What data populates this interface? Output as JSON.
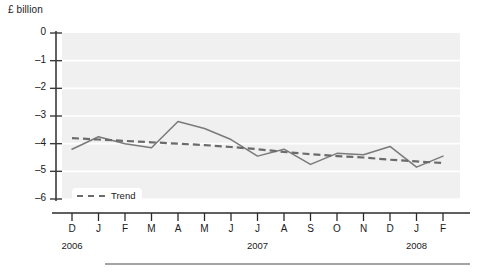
{
  "chart_data": {
    "type": "line",
    "title": "",
    "subtitle": "",
    "xlabel": "",
    "ylabel": "£ billion",
    "ylim": [
      -6,
      0
    ],
    "yticks": [
      0,
      -1,
      -2,
      -3,
      -4,
      -5,
      -6
    ],
    "ytick_labels": [
      "0",
      "–1",
      "–2",
      "–3",
      "–4",
      "–5",
      "–6"
    ],
    "grid": true,
    "grid_color": "#ffffff",
    "plot_bgcolor": "#f0f0f0",
    "legend_position": "bottom-left",
    "categories": [
      "D",
      "J",
      "F",
      "M",
      "A",
      "M",
      "J",
      "J",
      "A",
      "S",
      "O",
      "N",
      "D",
      "J",
      "F"
    ],
    "x_group_labels": [
      {
        "label": "2006",
        "index": 0
      },
      {
        "label": "2007",
        "index": 7
      },
      {
        "label": "2008",
        "index": 13
      }
    ],
    "series": [
      {
        "name": "Monthly",
        "color": "#7a7a7a",
        "style": "solid",
        "values": [
          -4.2,
          -3.75,
          -4.0,
          -4.15,
          -3.2,
          -3.45,
          -3.85,
          -4.45,
          -4.2,
          -4.75,
          -4.35,
          -4.4,
          -4.1,
          -4.85,
          -4.45
        ]
      },
      {
        "name": "Trend",
        "color": "#6b6b6b",
        "style": "dashed",
        "values": [
          -3.8,
          -3.85,
          -3.9,
          -3.95,
          -4.0,
          -4.05,
          -4.12,
          -4.2,
          -4.3,
          -4.38,
          -4.45,
          -4.5,
          -4.58,
          -4.64,
          -4.7
        ]
      }
    ],
    "legend": [
      {
        "label": "Trend",
        "style": "dashed",
        "color": "#6b6b6b"
      }
    ]
  },
  "axis": {
    "unit_label": "£ billion"
  }
}
